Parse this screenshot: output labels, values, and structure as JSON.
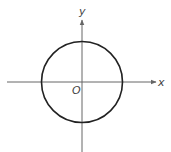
{
  "diagram": {
    "axes": {
      "x_label": "x",
      "y_label": "y",
      "origin_label": "O",
      "axis_color": "#666666"
    },
    "circle": {
      "center": [
        0,
        0
      ],
      "stroke_color": "#222222"
    }
  }
}
